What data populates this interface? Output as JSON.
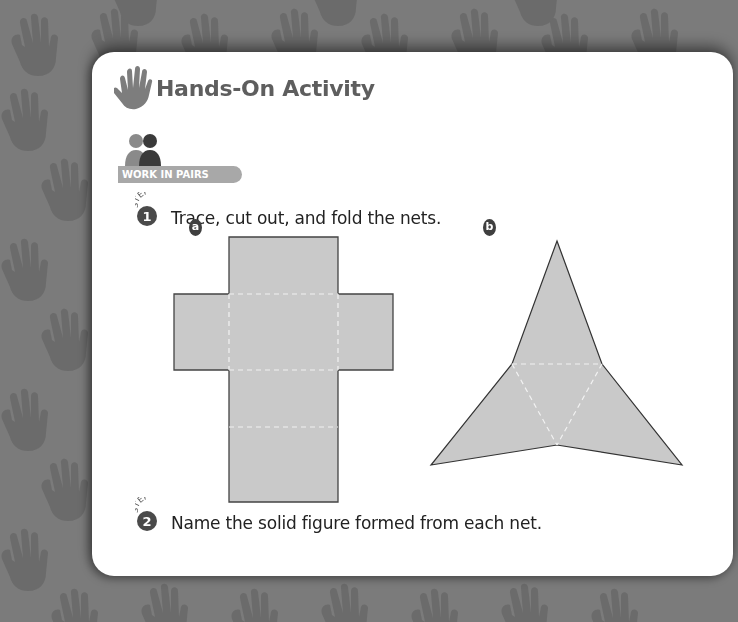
{
  "header": {
    "title": "Hands-On Activity",
    "icon": "hand-icon"
  },
  "badge": {
    "label": "WORK IN PAIRS",
    "icon": "two-people-icon"
  },
  "steps": [
    {
      "arc_label": "STEP",
      "number": "1",
      "text": "Trace, cut out, and fold the nets."
    },
    {
      "arc_label": "STEP",
      "number": "2",
      "text": "Name the solid figure formed from each net."
    }
  ],
  "nets": [
    {
      "label": "a",
      "shape": "cube-net"
    },
    {
      "label": "b",
      "shape": "triangular-pyramid-net"
    }
  ],
  "colors": {
    "background": "#7b7b7b",
    "card": "#ffffff",
    "net_fill": "#c9c9c9",
    "title": "#5e5e5e",
    "badge": "#a8a8a8",
    "step_circle": "#4a4a4a"
  }
}
